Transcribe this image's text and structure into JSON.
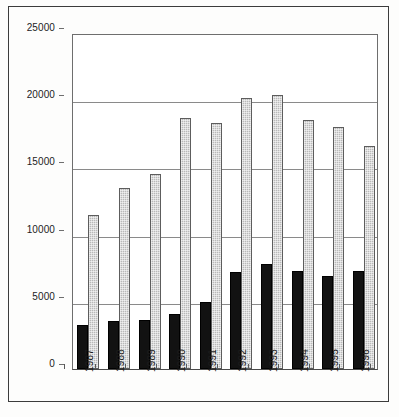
{
  "chart_data": {
    "type": "bar",
    "title": "",
    "subtitle": "",
    "xlabel": "",
    "ylabel": "",
    "grid": true,
    "legend_position": "none",
    "ylim": [
      0,
      25000
    ],
    "ytick_labels": [
      "0",
      "5000",
      "10000",
      "15000",
      "20000",
      "25000"
    ],
    "ytick_values": [
      0,
      5000,
      10000,
      15000,
      20000,
      25000
    ],
    "categories": [
      "1987",
      "1988",
      "1989",
      "1990",
      "1991",
      "1992",
      "1993",
      "1994",
      "1995",
      "1996"
    ],
    "series": [
      {
        "name": "series-dark",
        "color": "#121212",
        "values": [
          3250,
          3550,
          3680,
          4120,
          4980,
          7250,
          7830,
          7280,
          6900,
          7300
        ]
      },
      {
        "name": "series-light",
        "color": "#b9b9b9",
        "values": [
          11450,
          13450,
          14500,
          18650,
          18300,
          20200,
          20350,
          18550,
          18000,
          16600
        ]
      }
    ]
  }
}
